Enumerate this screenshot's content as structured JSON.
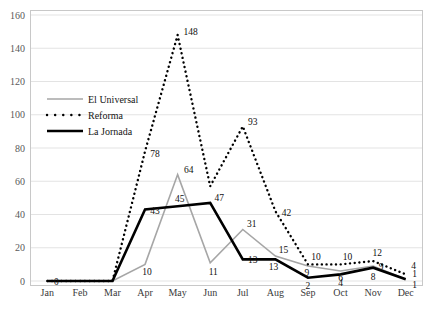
{
  "chart_data": {
    "type": "line",
    "title": "",
    "xlabel": "",
    "ylabel": "",
    "categories": [
      "Jan",
      "Feb",
      "Mar",
      "Apr",
      "May",
      "Jun",
      "Jul",
      "Aug",
      "Sep",
      "Oct",
      "Nov",
      "Dec"
    ],
    "ylim": [
      0,
      160
    ],
    "ytick_labels": [
      "0",
      "20",
      "40",
      "60",
      "80",
      "100",
      "120",
      "140",
      "160"
    ],
    "yticks": [
      0,
      20,
      40,
      60,
      80,
      100,
      120,
      140,
      160
    ],
    "grid": "horizontal",
    "legend_position": "inside-left-upper",
    "series": [
      {
        "name": "El Universal",
        "style": "solid-thin-gray",
        "color": "#a6a6a6",
        "values": [
          0,
          0,
          0,
          10,
          64,
          11,
          31,
          15,
          9,
          6,
          9,
          1
        ],
        "labels": [
          "",
          "",
          "",
          "10",
          "64",
          "11",
          "31",
          "15",
          "9",
          "6",
          "9",
          "1"
        ]
      },
      {
        "name": "Reforma",
        "style": "dotted-black",
        "color": "#000000",
        "values": [
          0,
          0,
          0,
          78,
          148,
          57,
          93,
          42,
          10,
          10,
          12,
          4
        ],
        "labels": [
          "",
          "",
          "",
          "78",
          "148",
          "",
          "93",
          "42",
          "10",
          "10",
          "12",
          "4"
        ]
      },
      {
        "name": "La Jornada",
        "style": "solid-bold-black",
        "color": "#000000",
        "values": [
          0,
          0,
          0,
          43,
          45,
          47,
          13,
          13,
          2,
          4,
          8,
          1
        ],
        "labels": [
          "0",
          "",
          "",
          "43",
          "45",
          "47",
          "13",
          "13",
          "2",
          "4",
          "8",
          "1"
        ]
      }
    ],
    "annotations": [
      {
        "text": "0",
        "series": "La Jornada",
        "category": "Mar"
      },
      {
        "text": "10",
        "series": "El Universal",
        "category": "Apr"
      },
      {
        "text": "43",
        "series": "La Jornada",
        "category": "Apr"
      },
      {
        "text": "78",
        "series": "Reforma",
        "category": "Apr"
      },
      {
        "text": "148",
        "series": "Reforma",
        "category": "May"
      },
      {
        "text": "64",
        "series": "El Universal",
        "category": "May"
      },
      {
        "text": "45",
        "series": "La Jornada",
        "category": "May"
      },
      {
        "text": "47",
        "series": "La Jornada",
        "category": "Jun"
      },
      {
        "text": "11",
        "series": "El Universal",
        "category": "Jun"
      },
      {
        "text": "93",
        "series": "Reforma",
        "category": "Jul"
      },
      {
        "text": "31",
        "series": "El Universal",
        "category": "Jul"
      },
      {
        "text": "13",
        "series": "La Jornada",
        "category": "Jul"
      },
      {
        "text": "42",
        "series": "Reforma",
        "category": "Aug"
      },
      {
        "text": "15",
        "series": "El Universal",
        "category": "Aug"
      },
      {
        "text": "13",
        "series": "La Jornada",
        "category": "Aug"
      },
      {
        "text": "10",
        "series": "Reforma",
        "category": "Sep"
      },
      {
        "text": "9",
        "series": "El Universal",
        "category": "Sep"
      },
      {
        "text": "2",
        "series": "La Jornada",
        "category": "Sep"
      },
      {
        "text": "10",
        "series": "Reforma",
        "category": "Oct"
      },
      {
        "text": "6",
        "series": "El Universal",
        "category": "Oct"
      },
      {
        "text": "4",
        "series": "La Jornada",
        "category": "Oct"
      },
      {
        "text": "12",
        "series": "Reforma",
        "category": "Nov"
      },
      {
        "text": "9",
        "series": "El Universal",
        "category": "Nov"
      },
      {
        "text": "8",
        "series": "La Jornada",
        "category": "Nov"
      },
      {
        "text": "4",
        "series": "Reforma",
        "category": "Dec"
      },
      {
        "text": "1",
        "series": "El Universal",
        "category": "Dec"
      },
      {
        "text": "1",
        "series": "La Jornada",
        "category": "Dec"
      }
    ]
  },
  "legend": {
    "entries": [
      {
        "label": "El Universal"
      },
      {
        "label": "Reforma"
      },
      {
        "label": "La Jornada"
      }
    ]
  }
}
